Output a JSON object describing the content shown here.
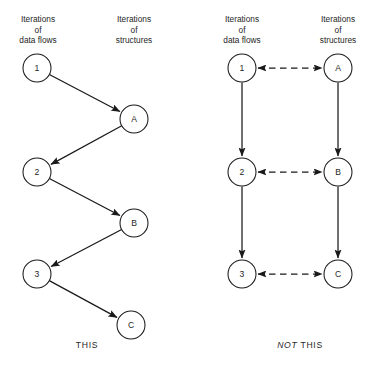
{
  "figure": {
    "background": "#ffffff",
    "ink": "#1a1a1a",
    "width": 373,
    "height": 370
  },
  "panels": [
    {
      "id": "this",
      "caption": "THIS",
      "caption_emphasis": "",
      "caption_x": 87,
      "caption_y": 348,
      "headers": [
        {
          "name": "data-flows",
          "lines": [
            "Iterations",
            "of",
            "data flows"
          ],
          "x": 38,
          "y": 22
        },
        {
          "name": "structures",
          "lines": [
            "Iterations",
            "of",
            "structures"
          ],
          "x": 134,
          "y": 22
        }
      ],
      "nodes": [
        {
          "id": "1",
          "label": "1",
          "x": 37,
          "y": 68,
          "r": 14,
          "column": "data-flows"
        },
        {
          "id": "A",
          "label": "A",
          "x": 134,
          "y": 119,
          "r": 14,
          "column": "structures"
        },
        {
          "id": "2",
          "label": "2",
          "x": 37,
          "y": 172,
          "r": 14,
          "column": "data-flows"
        },
        {
          "id": "B",
          "label": "B",
          "x": 134,
          "y": 223,
          "r": 14,
          "column": "structures"
        },
        {
          "id": "3",
          "label": "3",
          "x": 37,
          "y": 274,
          "r": 14,
          "column": "data-flows"
        },
        {
          "id": "C",
          "label": "C",
          "x": 131,
          "y": 325,
          "r": 14,
          "column": "structures"
        }
      ],
      "edges": [
        {
          "from": "1",
          "to": "A",
          "style": "solid",
          "heads": "end"
        },
        {
          "from": "A",
          "to": "2",
          "style": "solid",
          "heads": "end"
        },
        {
          "from": "2",
          "to": "B",
          "style": "solid",
          "heads": "end"
        },
        {
          "from": "B",
          "to": "3",
          "style": "solid",
          "heads": "end"
        },
        {
          "from": "3",
          "to": "C",
          "style": "solid",
          "heads": "end"
        }
      ]
    },
    {
      "id": "not-this",
      "caption": "THIS",
      "caption_emphasis": "NOT",
      "caption_x": 300,
      "caption_y": 348,
      "headers": [
        {
          "name": "data-flows",
          "lines": [
            "Iterations",
            "of",
            "data flows"
          ],
          "x": 242,
          "y": 22
        },
        {
          "name": "structures",
          "lines": [
            "Iterations",
            "of",
            "structures"
          ],
          "x": 338,
          "y": 22
        }
      ],
      "nodes": [
        {
          "id": "1",
          "label": "1",
          "x": 242,
          "y": 68,
          "r": 14,
          "column": "data-flows"
        },
        {
          "id": "A",
          "label": "A",
          "x": 338,
          "y": 68,
          "r": 14,
          "column": "structures"
        },
        {
          "id": "2",
          "label": "2",
          "x": 242,
          "y": 172,
          "r": 14,
          "column": "data-flows"
        },
        {
          "id": "B",
          "label": "B",
          "x": 338,
          "y": 172,
          "r": 14,
          "column": "structures"
        },
        {
          "id": "3",
          "label": "3",
          "x": 242,
          "y": 274,
          "r": 14,
          "column": "data-flows"
        },
        {
          "id": "C",
          "label": "C",
          "x": 338,
          "y": 274,
          "r": 14,
          "column": "structures"
        }
      ],
      "edges": [
        {
          "from": "1",
          "to": "A",
          "style": "dashed",
          "heads": "both"
        },
        {
          "from": "2",
          "to": "B",
          "style": "dashed",
          "heads": "both"
        },
        {
          "from": "3",
          "to": "C",
          "style": "dashed",
          "heads": "both"
        },
        {
          "from": "1",
          "to": "2",
          "style": "solid",
          "heads": "end"
        },
        {
          "from": "2",
          "to": "3",
          "style": "solid",
          "heads": "end"
        },
        {
          "from": "A",
          "to": "B",
          "style": "solid",
          "heads": "end"
        },
        {
          "from": "B",
          "to": "C",
          "style": "solid",
          "heads": "end"
        }
      ]
    }
  ]
}
